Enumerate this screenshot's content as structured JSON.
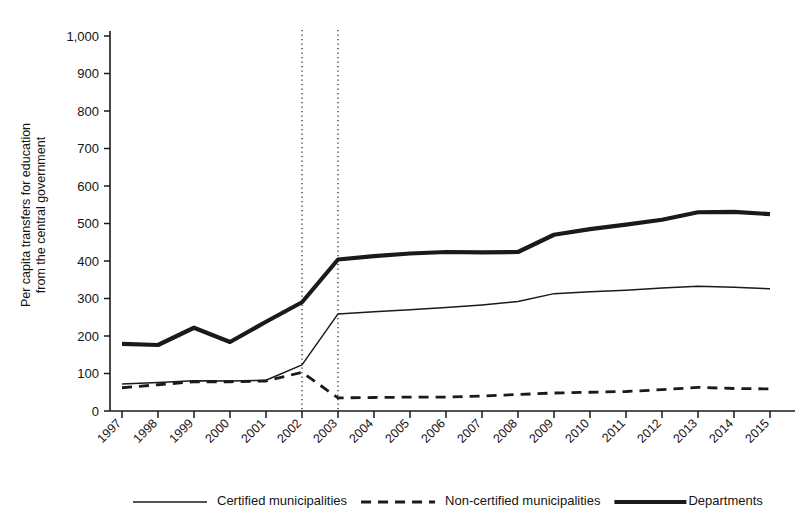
{
  "chart_data": {
    "type": "line",
    "title": "",
    "xlabel": "",
    "ylabel": "Per capita transfers for education from the central government",
    "ylabel_line1": "Per capita transfers for education",
    "ylabel_line2": "from the central government",
    "ylim": [
      0,
      1000
    ],
    "ytick_step": 100,
    "yticks": [
      "0",
      "100",
      "200",
      "300",
      "400",
      "500",
      "600",
      "700",
      "800",
      "900",
      "1,000"
    ],
    "grid": false,
    "legend_position": "bottom",
    "categories": [
      "1997",
      "1998",
      "1999",
      "2000",
      "2001",
      "2002",
      "2003",
      "2004",
      "2005",
      "2006",
      "2007",
      "2008",
      "2009",
      "2010",
      "2011",
      "2012",
      "2013",
      "2014",
      "2015"
    ],
    "x": [
      1997,
      1998,
      1999,
      2000,
      2001,
      2002,
      2003,
      2004,
      2005,
      2006,
      2007,
      2008,
      2009,
      2010,
      2011,
      2012,
      2013,
      2014,
      2015
    ],
    "series": [
      {
        "name": "Certified municipalities",
        "style": "solid-thin",
        "color": "#1a1a1a",
        "values": [
          72,
          76,
          81,
          80,
          82,
          123,
          259,
          265,
          270,
          276,
          283,
          292,
          313,
          318,
          322,
          328,
          333,
          330,
          326
        ]
      },
      {
        "name": "Non-certified municipalities",
        "style": "dashed",
        "color": "#1a1a1a",
        "values": [
          62,
          70,
          78,
          78,
          80,
          103,
          35,
          36,
          37,
          37,
          40,
          44,
          48,
          50,
          52,
          57,
          63,
          60,
          59
        ]
      },
      {
        "name": "Departments",
        "style": "solid-thick",
        "color": "#1a1a1a",
        "values": [
          179,
          176,
          222,
          184,
          238,
          290,
          404,
          413,
          420,
          424,
          423,
          424,
          470,
          485,
          497,
          510,
          530,
          531,
          525
        ]
      }
    ],
    "annotations": [
      {
        "type": "vertical-dotted-line",
        "x": 2002,
        "label": ""
      },
      {
        "type": "vertical-dotted-line",
        "x": 2003,
        "label": ""
      }
    ]
  },
  "legend": {
    "items": [
      {
        "label": "Certified municipalities",
        "marker": "solid-thin-line"
      },
      {
        "label": "Non-certified municipalities",
        "marker": "dashed-line"
      },
      {
        "label": "Departments",
        "marker": "solid-thick-line"
      }
    ]
  }
}
